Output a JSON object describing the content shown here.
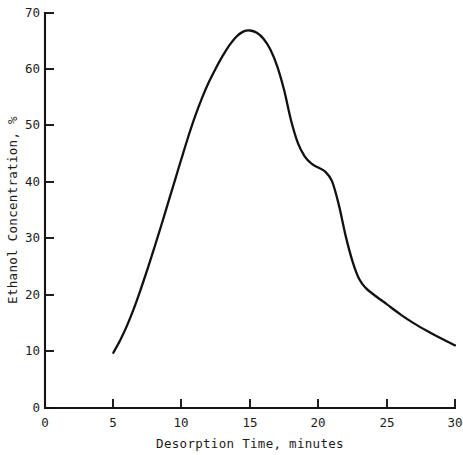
{
  "chart_data": {
    "type": "line",
    "title": "",
    "subtitle": "",
    "xlabel": "Desorption Time, minutes",
    "ylabel": "Ethanol Concentration, %",
    "xlim": [
      0,
      30
    ],
    "ylim": [
      0,
      70
    ],
    "xticks": [
      0,
      5,
      10,
      15,
      20,
      25,
      30
    ],
    "xtick_labels": [
      "0",
      "5",
      "10",
      "15",
      "20",
      "25",
      "30"
    ],
    "yticks": [
      0,
      10,
      20,
      30,
      40,
      50,
      60,
      70
    ],
    "ytick_labels": [
      "0",
      "10",
      "20",
      "30",
      "40",
      "50",
      "60",
      "70"
    ],
    "grid": false,
    "legend": false,
    "legend_position": "none",
    "line_color": "#111111",
    "background_color": "#ffffff",
    "series": [
      {
        "name": "Ethanol Concentration",
        "x": [
          5.0,
          5.5,
          6.0,
          6.5,
          7.0,
          7.5,
          8.0,
          8.5,
          9.0,
          9.5,
          10.0,
          10.5,
          11.0,
          11.5,
          12.0,
          12.5,
          13.0,
          13.5,
          14.0,
          14.5,
          15.0,
          15.5,
          16.0,
          16.5,
          17.0,
          17.5,
          18.0,
          18.5,
          19.0,
          19.5,
          20.0,
          20.5,
          21.0,
          21.5,
          22.0,
          22.5,
          23.0,
          23.5,
          24.0,
          25.0,
          26.0,
          27.0,
          28.0,
          29.0,
          30.0
        ],
        "y": [
          9.8,
          12.0,
          14.6,
          17.6,
          21.0,
          24.6,
          28.4,
          32.3,
          36.3,
          40.3,
          44.3,
          48.2,
          51.8,
          55.0,
          57.8,
          60.2,
          62.4,
          64.3,
          65.8,
          66.7,
          66.9,
          66.5,
          65.4,
          63.5,
          60.5,
          56.3,
          51.0,
          47.0,
          44.6,
          43.3,
          42.6,
          41.9,
          40.2,
          36.0,
          30.5,
          26.0,
          22.8,
          21.2,
          20.2,
          18.4,
          16.6,
          15.0,
          13.6,
          12.3,
          11.1
        ]
      }
    ],
    "annotations": [],
    "notes": {
      "curve_start": "5 minutes at approximately 10%",
      "peak": "approximately 67% at about 15 minutes",
      "shoulder": "plateau near 42% between 19 and 21 minutes",
      "curve_end": "30 minutes at approximately 11%"
    }
  }
}
